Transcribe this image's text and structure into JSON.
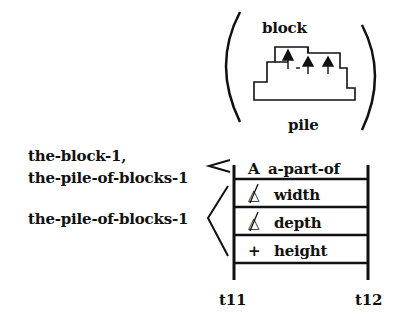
{
  "figure": {
    "top_labels": {
      "block": "block",
      "pile": "pile"
    },
    "left_labels": {
      "group1_line1": "the-block-1,",
      "group1_line2": "the-pile-of-blocks-1",
      "group2": "the-pile-of-blocks-1"
    },
    "rows": [
      {
        "symbol": "A",
        "label": "a-part-of"
      },
      {
        "symbol": "∄",
        "label": "width"
      },
      {
        "symbol": "∄",
        "label": "depth"
      },
      {
        "symbol": "+",
        "label": "height"
      }
    ],
    "time_labels": {
      "start": "t11",
      "end": "t12"
    }
  }
}
